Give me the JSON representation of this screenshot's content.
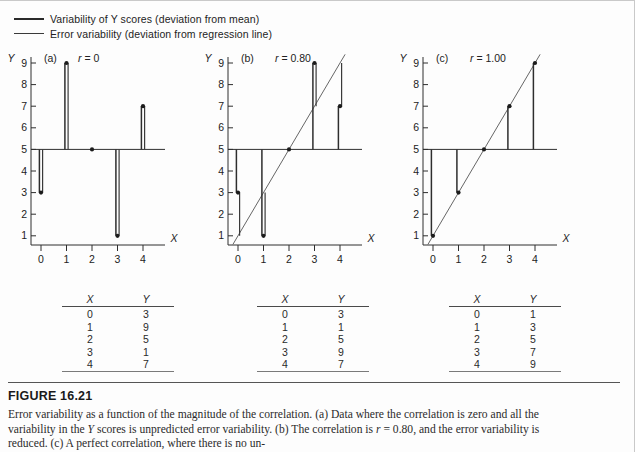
{
  "legend": {
    "items": [
      {
        "id": "variability-of-y",
        "label": "Variability of Y scores (deviation from mean)",
        "style": "thick"
      },
      {
        "id": "error-variability",
        "label": "Error variability (deviation from regression line)",
        "style": "thin"
      }
    ]
  },
  "axes": {
    "x_label": "X",
    "y_label": "Y",
    "x_ticks": [
      "0",
      "1",
      "2",
      "3",
      "4"
    ],
    "y_ticks": [
      "9",
      "8",
      "7",
      "6",
      "5",
      "4",
      "3",
      "2",
      "1"
    ],
    "x_min": 0,
    "x_max": 4,
    "y_min": 1,
    "y_max": 9,
    "mean_y": 5
  },
  "panels": [
    {
      "id": "a",
      "letter": "(a)",
      "stat_label": "r = 0",
      "r": 0,
      "mean_line": true,
      "regression_line": false,
      "regression_endpoints": null,
      "show_error_lines": true,
      "points": [
        {
          "x": 0,
          "y": 3
        },
        {
          "x": 1,
          "y": 9
        },
        {
          "x": 2,
          "y": 5
        },
        {
          "x": 3,
          "y": 1
        },
        {
          "x": 4,
          "y": 7
        }
      ]
    },
    {
      "id": "b",
      "letter": "(b)",
      "stat_label": "r = 0.80",
      "r": 0.8,
      "mean_line": true,
      "regression_line": true,
      "regression_endpoints": {
        "x1": -0.2,
        "y1": 0.6,
        "x2": 4.2,
        "y2": 9.4
      },
      "show_error_lines": true,
      "points": [
        {
          "x": 0,
          "y": 3
        },
        {
          "x": 1,
          "y": 1
        },
        {
          "x": 2,
          "y": 5
        },
        {
          "x": 3,
          "y": 9
        },
        {
          "x": 4,
          "y": 7
        }
      ]
    },
    {
      "id": "c",
      "letter": "(c)",
      "stat_label": "r = 1.00",
      "r": 1,
      "mean_line": true,
      "regression_line": true,
      "regression_endpoints": {
        "x1": -0.2,
        "y1": 0.6,
        "x2": 4.2,
        "y2": 9.4
      },
      "show_error_lines": false,
      "points": [
        {
          "x": 0,
          "y": 1
        },
        {
          "x": 1,
          "y": 3
        },
        {
          "x": 2,
          "y": 5
        },
        {
          "x": 3,
          "y": 7
        },
        {
          "x": 4,
          "y": 9
        }
      ]
    }
  ],
  "tables": [
    {
      "id": "a",
      "headers": [
        "X",
        "Y"
      ],
      "rows": [
        [
          "0",
          "3"
        ],
        [
          "1",
          "9"
        ],
        [
          "2",
          "5"
        ],
        [
          "3",
          "1"
        ],
        [
          "4",
          "7"
        ]
      ]
    },
    {
      "id": "b",
      "headers": [
        "X",
        "Y"
      ],
      "rows": [
        [
          "0",
          "3"
        ],
        [
          "1",
          "1"
        ],
        [
          "2",
          "5"
        ],
        [
          "3",
          "9"
        ],
        [
          "4",
          "7"
        ]
      ]
    },
    {
      "id": "c",
      "headers": [
        "X",
        "Y"
      ],
      "rows": [
        [
          "0",
          "1"
        ],
        [
          "1",
          "3"
        ],
        [
          "2",
          "5"
        ],
        [
          "3",
          "7"
        ],
        [
          "4",
          "9"
        ]
      ]
    }
  ],
  "figure": {
    "number": "FIGURE 16.21",
    "caption": "Error variability as a function of the magnitude of the correlation. (a) Data where the correlation is zero and all the variability in the Y scores is unpredicted error variability. (b) The correlation is r = 0.80, and the error variability is reduced. (c) A perfect correlation, where there is no un-"
  },
  "chart_data": {
    "type": "scatter",
    "title": "Error variability as a function of the magnitude of the correlation",
    "xlabel": "X",
    "ylabel": "Y",
    "xlim": [
      0,
      4
    ],
    "ylim": [
      1,
      9
    ],
    "grid": false,
    "legend_position": "top-left",
    "legend": [
      "Variability of Y scores (deviation from mean)",
      "Error variability (deviation from regression line)"
    ],
    "annotations": [
      "(a) r = 0",
      "(b) r = 0.80",
      "(c) r = 1.00"
    ],
    "mean_y": 5,
    "series": [
      {
        "name": "(a) r = 0",
        "x": [
          0,
          1,
          2,
          3,
          4
        ],
        "values": [
          3,
          9,
          5,
          1,
          7
        ]
      },
      {
        "name": "(b) r = 0.80",
        "x": [
          0,
          1,
          2,
          3,
          4
        ],
        "values": [
          3,
          1,
          5,
          9,
          7
        ]
      },
      {
        "name": "(c) r = 1.00",
        "x": [
          0,
          1,
          2,
          3,
          4
        ],
        "values": [
          1,
          3,
          5,
          7,
          9
        ]
      }
    ]
  }
}
